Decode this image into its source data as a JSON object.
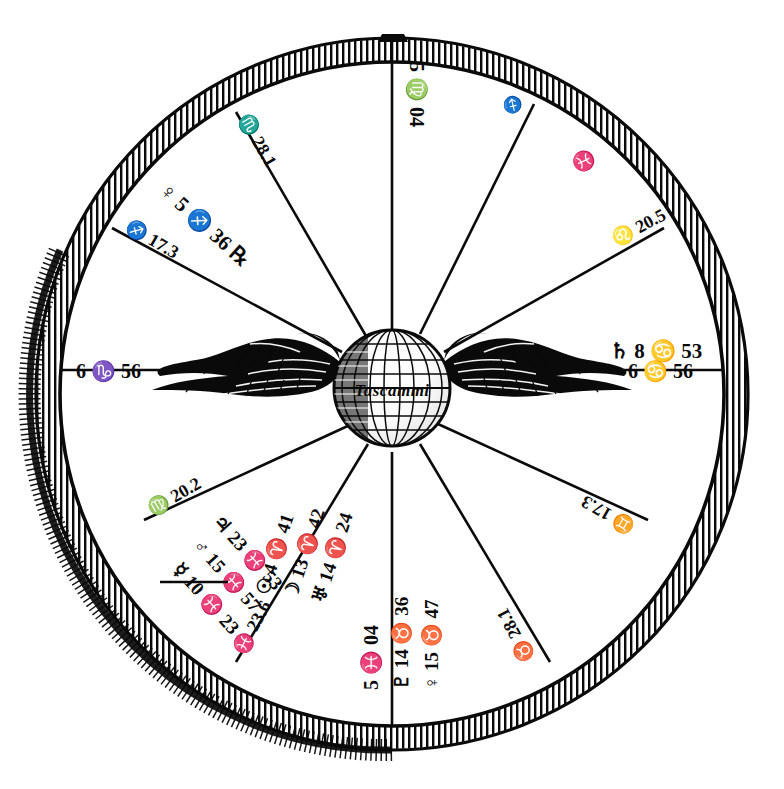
{
  "document": {
    "type": "astrological-birth-chart",
    "title": "Horoscope Wheel",
    "center_emblem": "winged-globe",
    "center_inscription": "Tascammi",
    "ink_color": "#0a0a0a",
    "paper_color": "#ffffff"
  },
  "wheel": {
    "outer_ring_style": "hatched",
    "house_count": 12,
    "spoke_count": 12
  },
  "cusps": [
    {
      "id": "mc",
      "label": "5 ♍ 04",
      "position": "top-center"
    },
    {
      "id": "c11",
      "label": "♏ 28.1",
      "position": "upper-left-inner"
    },
    {
      "id": "c12",
      "label": "♐ 17.3",
      "position": "upper-left-outer"
    },
    {
      "id": "asc",
      "label": "6 ♑ 56",
      "position": "left-center"
    },
    {
      "id": "c2",
      "label": "♍ 20.2",
      "position": "lower-left-outer"
    },
    {
      "id": "c3",
      "label": "♓ 23.6",
      "position": "lower-left-inner"
    },
    {
      "id": "ic",
      "label": "5 ♓ 04",
      "position": "bottom-center"
    },
    {
      "id": "c5",
      "label": "♉ 28.1",
      "position": "lower-right-inner"
    },
    {
      "id": "c6",
      "label": "♊ 17.3",
      "position": "lower-right-outer"
    },
    {
      "id": "desc",
      "label": "6 ♋ 56",
      "position": "right-center"
    },
    {
      "id": "c8",
      "label": "♌ 20.5",
      "position": "upper-right-outer"
    },
    {
      "id": "c9",
      "label": "♓",
      "position": "upper-right-inner"
    }
  ],
  "planets": [
    {
      "glyph": "♄",
      "name": "saturn",
      "label": "♄ 8 ♋ 53",
      "position": "right-upper"
    },
    {
      "glyph": "♀",
      "name": "venus-r",
      "label": "♀ 5 ♐ 36 ℞",
      "position": "upper-left"
    },
    {
      "glyph": "♃",
      "name": "jupiter",
      "label": "♃ 23 ♓ 53",
      "position": "lower-left"
    },
    {
      "glyph": "♂",
      "name": "mars",
      "label": "♂ 15 ♓ 57",
      "position": "lower-left"
    },
    {
      "glyph": "☿",
      "name": "mercury",
      "label": "☿ 10 ♓ 23",
      "position": "lower-left"
    },
    {
      "glyph": "☉",
      "name": "sun",
      "label": "☉ 4 ♈ 41",
      "position": "bottom-left-center"
    },
    {
      "glyph": "☽",
      "name": "moon",
      "label": "☽ 13 ♈ 42",
      "position": "bottom-left-center"
    },
    {
      "glyph": "♅",
      "name": "uranus",
      "label": "♅ 14 ♈ 24",
      "position": "bottom-left-center"
    },
    {
      "glyph": "♇",
      "name": "pluto",
      "label": "♇ 14 ♉ 36",
      "position": "bottom-right-center"
    },
    {
      "glyph": "♀",
      "name": "venus",
      "label": "♀ 15 ♉ 47",
      "position": "bottom-right-center"
    }
  ],
  "marks": {
    "upper_right_sigil": "♓",
    "upper_right_small": "♐"
  }
}
